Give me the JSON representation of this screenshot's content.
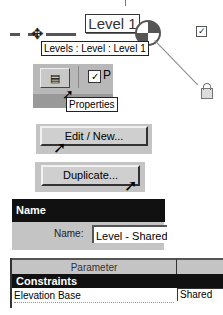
{
  "canvas": {
    "level_name": "Level 1",
    "tooltip_level": "Levels : Level : Level 1",
    "move_icon": "four-arrow-move-icon",
    "bubble_icon": "level-head-bubble-icon",
    "checkbox_icon": "checked-box-icon",
    "lock_icon": "padlock-icon"
  },
  "toolbar": {
    "properties_icon": "element-properties-icon",
    "checkbox_label": "P",
    "tooltip": "Properties"
  },
  "buttons": {
    "edit_new": "Edit / New...",
    "duplicate": "Duplicate..."
  },
  "name_section": {
    "header": "Name",
    "label": "Name:",
    "value": "Level - Shared"
  },
  "parameters_table": {
    "columns": [
      "Parameter",
      ""
    ],
    "group": "Constraints",
    "rows": [
      {
        "parameter": "Elevation Base",
        "value": "Shared"
      }
    ]
  },
  "colors": {
    "dialog_gray": "#c4c4c4",
    "header_black": "#111111"
  }
}
